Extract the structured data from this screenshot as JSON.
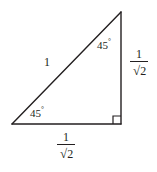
{
  "figure": {
    "background_color": "#ffffff",
    "line_color": "#231f20",
    "vertices": {
      "bottom_left": [
        12,
        124
      ],
      "bottom_right": [
        121,
        124
      ],
      "apex": [
        121,
        12
      ]
    },
    "right_angle_marker": {
      "at": "bottom_right",
      "size": 8
    },
    "labels": {
      "hypotenuse": "1",
      "angle_left": "45",
      "angle_right": "45",
      "degree_symbol": "°",
      "vertical_leg": {
        "numerator": "1",
        "denominator_radicand": "2",
        "radical_symbol": "√"
      },
      "horizontal_leg": {
        "numerator": "1",
        "denominator_radicand": "2",
        "radical_symbol": "√"
      }
    }
  }
}
